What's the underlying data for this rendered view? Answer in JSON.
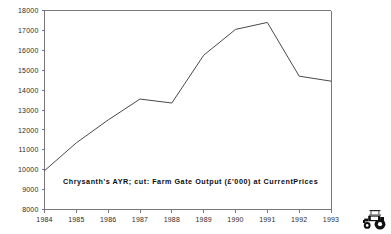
{
  "chart_data": {
    "type": "line",
    "title": "",
    "subtitle": "Chrysanth's AYR; cut: Farm Gate Output (£'000) at CurrentPrices",
    "xlabel": "",
    "ylabel": "",
    "categories": [
      "1984",
      "1985",
      "1986",
      "1987",
      "1988",
      "1989",
      "1990",
      "1991",
      "1992",
      "1993"
    ],
    "values": [
      9950,
      11350,
      12500,
      13550,
      13350,
      15750,
      17050,
      17400,
      14700,
      14450
    ],
    "series": [
      {
        "name": "Farm Gate Output",
        "values": [
          9950,
          11350,
          12500,
          13550,
          13350,
          15750,
          17050,
          17400,
          14700,
          14450
        ]
      }
    ],
    "ylim": [
      8000,
      18000
    ],
    "ytick_labels": [
      "8000",
      "9000",
      "10000",
      "11000",
      "12000",
      "13000",
      "14000",
      "15000",
      "16000",
      "17000",
      "18000"
    ],
    "ytick_values": [
      8000,
      9000,
      10000,
      11000,
      12000,
      13000,
      14000,
      15000,
      16000,
      17000,
      18000
    ],
    "xtick_labels": [
      "1984",
      "1985",
      "1986",
      "1987",
      "1988",
      "1989",
      "1990",
      "1991",
      "1992",
      "1993"
    ],
    "grid": false,
    "legend": "none",
    "line_color": "#4a4a4a",
    "axis_color": "#6a6a6a",
    "text_color": "#2b2b2b"
  },
  "decor": {
    "tractor_icon_name": "tractor-icon"
  }
}
